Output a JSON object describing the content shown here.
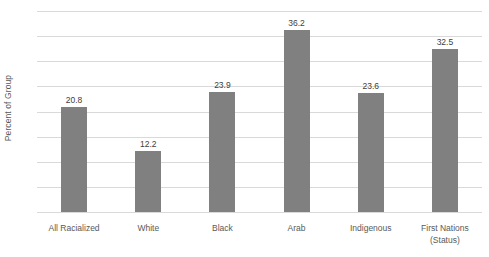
{
  "chart_data": {
    "type": "bar",
    "title": "",
    "xlabel": "",
    "ylabel": "Percent of Group",
    "ylim": [
      0,
      40
    ],
    "ytick_step": 5,
    "yticks": [
      "40",
      "35",
      "30",
      "25",
      "20",
      "15",
      "10",
      "5",
      "0"
    ],
    "grid": true,
    "legend": "none",
    "bar_color": "#808080",
    "gridline_color": "#d9d9d9",
    "categories": [
      "All Racialized",
      "White",
      "Black",
      "Arab",
      "Indigenous",
      "First Nations\n(Status)"
    ],
    "category_lines": [
      [
        "All Racialized"
      ],
      [
        "White"
      ],
      [
        "Black"
      ],
      [
        "Arab"
      ],
      [
        "Indigenous"
      ],
      [
        "First Nations",
        "(Status)"
      ]
    ],
    "values": [
      20.8,
      12.2,
      23.9,
      36.2,
      23.6,
      32.5
    ],
    "data_labels": [
      "20.8",
      "12.2",
      "23.9",
      "36.2",
      "23.6",
      "32.5"
    ]
  }
}
